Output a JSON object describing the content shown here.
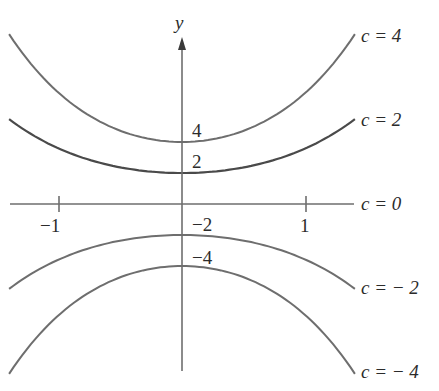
{
  "chart_data": {
    "type": "line",
    "title": "",
    "xlabel": "",
    "ylabel": "y",
    "x_ticks": [
      {
        "value": -1,
        "label": "−1"
      },
      {
        "value": 1,
        "label": "1"
      }
    ],
    "y_intercept_labels": [
      {
        "value": 4,
        "label": "4"
      },
      {
        "value": 2,
        "label": "2"
      },
      {
        "value": -2,
        "label": "−2"
      },
      {
        "value": -4,
        "label": "−4"
      }
    ],
    "xlim": [
      -1.4,
      1.4
    ],
    "grid": false,
    "legend_position": "right (inline labels at curve ends)",
    "series": [
      {
        "name": "c = 4",
        "c": 4,
        "y_at_x0": 4,
        "y_at_x_pm1": 7.2,
        "y_at_x_pm1_4": 10.8
      },
      {
        "name": "c = 2",
        "c": 2,
        "y_at_x0": 2,
        "y_at_x_pm1": 3.6,
        "y_at_x_pm1_4": 5.4
      },
      {
        "name": "c = 0",
        "c": 0,
        "y_at_x0": 0,
        "y_at_x_pm1": 0,
        "y_at_x_pm1_4": 0
      },
      {
        "name": "c = − 2",
        "c": -2,
        "y_at_x0": -2,
        "y_at_x_pm1": -3.6,
        "y_at_x_pm1_4": -5.4
      },
      {
        "name": "c = − 4",
        "c": -4,
        "y_at_x0": -4,
        "y_at_x_pm1": -7.2,
        "y_at_x_pm1_4": -10.8
      }
    ]
  },
  "labels": {
    "y_axis": "y",
    "tick_neg1": "−1",
    "tick_pos1": "1",
    "int_4": "4",
    "int_2": "2",
    "int_neg2": "−2",
    "int_neg4": "−4",
    "c4": "c = 4",
    "c2": "c = 2",
    "c0": "c = 0",
    "cneg2": "c = − 2",
    "cneg4": "c = − 4"
  },
  "colors": {
    "curve": "#6e6e6e",
    "highlight_curve": "#4a4a4a",
    "text": "#2b2b2b",
    "background": "#ffffff"
  }
}
